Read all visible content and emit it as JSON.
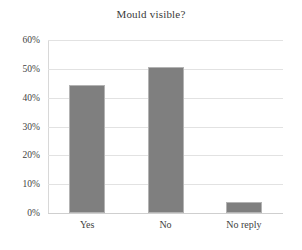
{
  "chart_data": {
    "type": "bar",
    "title": "Mould visible?",
    "xlabel": "",
    "ylabel": "",
    "categories": [
      "Yes",
      "No",
      "No reply"
    ],
    "values": [
      44.4,
      50.6,
      3.8
    ],
    "value_labels": [
      "44.4%",
      "50.6%",
      "3.8%"
    ],
    "ylim": [
      0,
      60
    ],
    "ytick_values": [
      0,
      10,
      20,
      30,
      40,
      50,
      60
    ],
    "ytick_labels": [
      "0%",
      "10%",
      "20%",
      "30%",
      "40%",
      "50%",
      "60%"
    ],
    "grid": true,
    "grid_axis": "y",
    "legend": false,
    "legend_position": "none",
    "series": [
      {
        "name": "Mould visible?",
        "values": [
          44.4,
          50.6,
          3.8
        ]
      }
    ],
    "colors": {
      "bar_fill": "#7f7f7f",
      "bar_border": "#b3b3b3",
      "gridline": "#e2e2e2",
      "axis_line": "#d8d8d8",
      "text": "#3f3f3f",
      "title_text": "#3a3a3a",
      "background": "#ffffff"
    }
  }
}
